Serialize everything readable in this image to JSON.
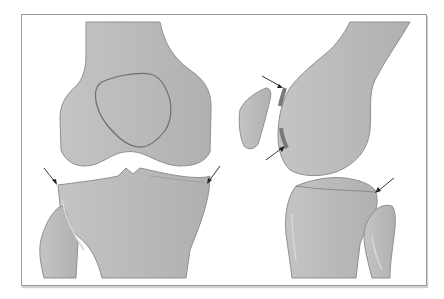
{
  "figure": {
    "type": "anatomical illustration",
    "panels": [
      {
        "id": "anterior-view",
        "label": "",
        "parts": [
          "femur",
          "patella-outline",
          "tibia",
          "fibula"
        ],
        "arrow_count": 2
      },
      {
        "id": "lateral-view",
        "label": "",
        "parts": [
          "femur",
          "patella",
          "tibia",
          "fibula",
          "cartilage-highlight"
        ],
        "arrow_count": 3
      }
    ],
    "colors": {
      "bone_fill": "#bdbdbd",
      "bone_outline": "#8a8a8a",
      "highlight": "#d9d9d9",
      "cartilage": "#7a7a7a",
      "arrow": "#222222",
      "frame": "#9a9a9a"
    }
  }
}
